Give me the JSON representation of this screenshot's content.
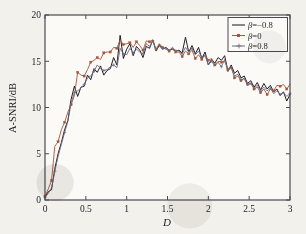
{
  "figure": {
    "background_color": "#f3f1ec",
    "plot_background_color": "#fbfaf7",
    "axis_color": "#4a4a52",
    "type_label": "line-chart"
  },
  "axes": {
    "x_label": "D",
    "y_label": "A-SNRI/dB",
    "x_ticks": [
      "0",
      "0.5",
      "1",
      "1.5",
      "2",
      "2.5",
      "3"
    ],
    "x_tick_values": [
      0,
      0.5,
      1,
      1.5,
      2,
      2.5,
      3
    ],
    "y_ticks": [
      "0",
      "5",
      "10",
      "15",
      "20"
    ],
    "y_tick_values": [
      0,
      5,
      10,
      15,
      20
    ]
  },
  "legend": {
    "position": "top-right",
    "entries": [
      {
        "label": "β=−0.8",
        "color": "#14141e",
        "marker": "none"
      },
      {
        "label": "β=0",
        "color": "#a4553c",
        "marker": "square"
      },
      {
        "label": "β=0.8",
        "color": "#6b6b80",
        "marker": "plus"
      }
    ]
  },
  "chart_data": {
    "type": "line",
    "title": "",
    "subtitle": "",
    "xlabel": "D",
    "ylabel": "A-SNRI/dB",
    "xlim": [
      0,
      3
    ],
    "ylim": [
      0,
      20
    ],
    "grid": false,
    "legend_position": "upper right",
    "x": [
      0.0,
      0.04,
      0.08,
      0.12,
      0.16,
      0.2,
      0.24,
      0.28,
      0.32,
      0.36,
      0.4,
      0.44,
      0.48,
      0.52,
      0.56,
      0.6,
      0.64,
      0.68,
      0.72,
      0.76,
      0.8,
      0.84,
      0.88,
      0.92,
      0.96,
      1.0,
      1.04,
      1.08,
      1.12,
      1.16,
      1.2,
      1.24,
      1.28,
      1.32,
      1.36,
      1.4,
      1.44,
      1.48,
      1.52,
      1.56,
      1.6,
      1.64,
      1.68,
      1.72,
      1.76,
      1.8,
      1.84,
      1.88,
      1.92,
      1.96,
      2.0,
      2.04,
      2.08,
      2.12,
      2.16,
      2.2,
      2.24,
      2.28,
      2.32,
      2.36,
      2.4,
      2.44,
      2.48,
      2.52,
      2.56,
      2.6,
      2.64,
      2.68,
      2.72,
      2.76,
      2.8,
      2.84,
      2.88,
      2.92,
      2.96,
      3.0
    ],
    "series": [
      {
        "name": "β=−0.8",
        "color": "#14141e",
        "marker": "none",
        "values": [
          0.3,
          0.9,
          1.1,
          3.4,
          5.0,
          6.2,
          7.6,
          8.6,
          10.9,
          12.3,
          11.2,
          12.2,
          12.3,
          13.5,
          13.0,
          14.2,
          13.8,
          14.5,
          13.5,
          14.0,
          14.2,
          15.4,
          14.6,
          17.8,
          15.3,
          16.3,
          16.9,
          15.6,
          16.6,
          16.2,
          15.4,
          16.6,
          16.4,
          17.3,
          16.1,
          16.8,
          16.3,
          16.5,
          16.2,
          16.3,
          16.1,
          16.2,
          15.9,
          17.6,
          16.0,
          16.7,
          15.8,
          16.5,
          15.3,
          16.0,
          14.6,
          15.2,
          14.8,
          15.4,
          15.1,
          15.6,
          13.9,
          14.6,
          13.7,
          14.0,
          13.2,
          13.4,
          12.6,
          12.9,
          12.2,
          12.7,
          11.9,
          12.6,
          12.0,
          12.4,
          11.7,
          12.0,
          11.3,
          11.7,
          10.7,
          11.4
        ]
      },
      {
        "name": "β=0",
        "color": "#a4553c",
        "marker": "square",
        "values": [
          0.4,
          1.2,
          2.1,
          5.8,
          6.3,
          7.6,
          8.4,
          9.5,
          10.3,
          11.3,
          13.8,
          13.5,
          13.4,
          14.1,
          14.9,
          15.1,
          15.4,
          15.2,
          15.9,
          16.0,
          16.0,
          16.5,
          16.4,
          17.3,
          16.8,
          16.9,
          17.0,
          16.5,
          17.1,
          16.7,
          16.2,
          17.2,
          17.1,
          17.3,
          16.3,
          16.9,
          16.5,
          16.3,
          16.1,
          16.4,
          16.0,
          16.0,
          15.5,
          16.1,
          15.8,
          16.2,
          15.3,
          15.7,
          15.2,
          15.7,
          15.1,
          15.3,
          14.6,
          15.0,
          14.9,
          15.0,
          14.1,
          14.4,
          13.2,
          13.4,
          12.9,
          13.2,
          12.5,
          12.6,
          12.0,
          12.2,
          11.6,
          12.0,
          11.4,
          12.0,
          11.8,
          12.4,
          12.3,
          12.5,
          12.0,
          12.5
        ]
      },
      {
        "name": "β=0.8",
        "color": "#6b6b80",
        "marker": "plus",
        "values": [
          0.3,
          0.7,
          1.3,
          3.1,
          4.7,
          6.0,
          7.3,
          8.5,
          10.5,
          11.6,
          11.8,
          12.1,
          12.5,
          13.2,
          13.4,
          13.9,
          14.6,
          14.2,
          14.0,
          14.1,
          14.4,
          14.6,
          14.3,
          16.4,
          15.8,
          15.7,
          16.4,
          15.9,
          16.3,
          16.0,
          15.8,
          16.9,
          16.6,
          17.2,
          16.2,
          16.6,
          16.4,
          16.4,
          16.2,
          16.4,
          16.2,
          16.1,
          15.8,
          16.5,
          16.0,
          16.4,
          15.7,
          16.1,
          15.4,
          15.6,
          14.6,
          15.0,
          14.5,
          14.9,
          14.4,
          15.2,
          14.0,
          14.3,
          13.4,
          13.6,
          13.0,
          13.1,
          12.4,
          12.6,
          12.1,
          12.4,
          11.8,
          12.2,
          11.8,
          12.1,
          11.5,
          11.8,
          11.4,
          11.6,
          11.2,
          11.5
        ]
      }
    ]
  }
}
